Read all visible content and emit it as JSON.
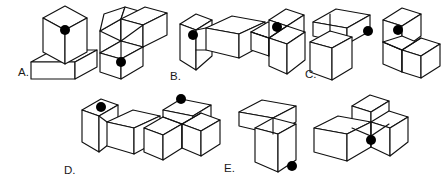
{
  "page": {
    "kind": "spatial-reasoning-question",
    "background_color": "#ffffff",
    "line_color": "#111111",
    "marker_color": "#000000",
    "width": 446,
    "height": 196
  },
  "options": [
    {
      "id": "A",
      "label": "A.",
      "label_x": 18,
      "label_y": 76,
      "figures": [
        {
          "name": "figure-a-left",
          "shape": "two stacked blocks, upright cube on a wide flat slab",
          "marker": {
            "cx": 65,
            "cy": 30,
            "r": 5.0
          }
        },
        {
          "name": "figure-a-right",
          "shape": "three-armed pinwheel of blocks",
          "marker": {
            "cx": 121,
            "cy": 62,
            "r": 5.0
          }
        }
      ]
    },
    {
      "id": "B",
      "label": "B.",
      "label_x": 170,
      "label_y": 80,
      "figures": [
        {
          "name": "figure-b-left",
          "shape": "tall block beside a long horizontal block",
          "marker": {
            "cx": 193,
            "cy": 35,
            "r": 5.0
          }
        },
        {
          "name": "figure-b-right",
          "shape": "three-armed pinwheel of blocks",
          "marker": {
            "cx": 277,
            "cy": 27,
            "r": 5.0
          }
        }
      ]
    },
    {
      "id": "C",
      "label": "C.",
      "label_x": 305,
      "label_y": 78,
      "figures": [
        {
          "name": "figure-c-left",
          "shape": "flat slab above an upright open block",
          "marker": {
            "cx": 368,
            "cy": 31,
            "r": 5.0
          }
        },
        {
          "name": "figure-c-right",
          "shape": "three-armed pinwheel of blocks",
          "marker": {
            "cx": 398,
            "cy": 30,
            "r": 5.0
          }
        }
      ]
    },
    {
      "id": "D",
      "label": "D.",
      "label_x": 64,
      "label_y": 174,
      "figures": [
        {
          "name": "figure-d-left",
          "shape": "upright block beside a tilted horizontal block",
          "marker": {
            "cx": 101,
            "cy": 107,
            "r": 5.0
          }
        },
        {
          "name": "figure-d-right",
          "shape": "three-armed pinwheel of blocks",
          "marker": {
            "cx": 181,
            "cy": 99,
            "r": 5.0
          }
        }
      ]
    },
    {
      "id": "E",
      "label": "E.",
      "label_x": 224,
      "label_y": 172,
      "figures": [
        {
          "name": "figure-e-left",
          "shape": "flat slab atop a tall upright block",
          "marker": {
            "cx": 292,
            "cy": 166,
            "r": 5.0
          }
        },
        {
          "name": "figure-e-right",
          "shape": "three-armed pinwheel of blocks",
          "marker": {
            "cx": 371,
            "cy": 140,
            "r": 5.0
          }
        }
      ]
    }
  ]
}
